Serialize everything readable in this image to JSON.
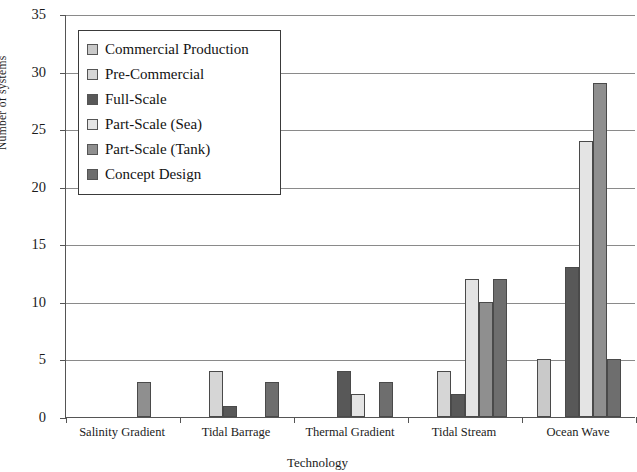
{
  "chart_data": {
    "type": "bar",
    "title": "",
    "xlabel": "Technology",
    "ylabel": "Number of systems",
    "ylim": [
      0,
      35
    ],
    "ytick_step": 5,
    "yticks": [
      0,
      5,
      10,
      15,
      20,
      25,
      30,
      35
    ],
    "grid": true,
    "legend_position": "upper-left-inside",
    "categories": [
      "Salinity Gradient",
      "Tidal Barrage",
      "Thermal Gradient",
      "Tidal Stream",
      "Ocean Wave"
    ],
    "series": [
      {
        "name": "Commercial Production",
        "color": "#c9c9c9",
        "values": [
          0,
          0,
          0,
          0,
          5
        ]
      },
      {
        "name": "Pre-Commercial",
        "color": "#d6d6d6",
        "values": [
          0,
          4,
          0,
          4,
          0
        ]
      },
      {
        "name": "Full-Scale",
        "color": "#585858",
        "values": [
          0,
          1,
          4,
          2,
          13
        ]
      },
      {
        "name": "Part-Scale (Sea)",
        "color": "#e4e4e4",
        "values": [
          0,
          0,
          2,
          12,
          24
        ]
      },
      {
        "name": "Part-Scale (Tank)",
        "color": "#8f8f8f",
        "values": [
          3,
          0,
          0,
          10,
          29
        ]
      },
      {
        "name": "Concept Design",
        "color": "#6e6e6e",
        "values": [
          0,
          3,
          3,
          12,
          5
        ]
      }
    ]
  },
  "legend": {
    "items": [
      {
        "label": "Commercial Production"
      },
      {
        "label": "Pre-Commercial"
      },
      {
        "label": "Full-Scale"
      },
      {
        "label": "Part-Scale (Sea)"
      },
      {
        "label": "Part-Scale (Tank)"
      },
      {
        "label": "Concept Design"
      }
    ]
  },
  "axes": {
    "y_title": "Number of systems",
    "x_title": "Technology",
    "y_tick_labels": [
      "0",
      "5",
      "10",
      "15",
      "20",
      "25",
      "30",
      "35"
    ],
    "x_tick_labels": [
      "Salinity Gradient",
      "Tidal Barrage",
      "Thermal Gradient",
      "Tidal Stream",
      "Ocean Wave"
    ]
  }
}
